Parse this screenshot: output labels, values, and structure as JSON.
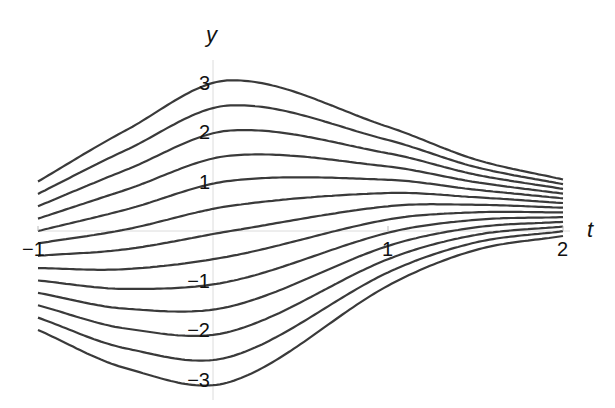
{
  "chart_data": {
    "type": "line",
    "title": "",
    "xlabel": "t",
    "ylabel": "y",
    "xlim": [
      -1,
      2
    ],
    "ylim": [
      -3.1,
      3.1
    ],
    "grid": false,
    "legend": null,
    "x_ticks": [
      -1,
      1,
      2
    ],
    "x_tick_labels": [
      "−1",
      "1",
      "2"
    ],
    "y_ticks": [
      3,
      2,
      1,
      -1,
      -2,
      -3
    ],
    "y_tick_labels": [
      "3",
      "2",
      "1",
      "−1",
      "−2",
      "−3"
    ],
    "initial_values": [
      1,
      0.75,
      0.5,
      0.25,
      0,
      -0.25,
      -0.5,
      -0.75,
      -1,
      -1.25,
      -1.5,
      -1.75,
      -2
    ],
    "model": {
      "form": "y(t) = (y0 + 0.5) * g(t) + c(t)",
      "t": [
        -1,
        -0.5,
        0.1,
        1,
        1.5,
        2
      ],
      "g": [
        1.0,
        1.6,
        2.03,
        1.07,
        0.61,
        0.38
      ],
      "c": [
        -0.5,
        -0.37,
        0.0,
        0.5,
        0.53,
        0.47
      ]
    },
    "series_samples": [
      {
        "name": "y0=1",
        "x": [
          -1,
          -0.5,
          0.1,
          1,
          1.5,
          2
        ],
        "y": [
          1.0,
          2.03,
          3.05,
          1.6,
          0.92,
          1.04
        ]
      },
      {
        "name": "y0=-2",
        "x": [
          -1,
          -0.5,
          0.1,
          1,
          1.5,
          2
        ],
        "y": [
          -2.0,
          -2.77,
          -3.05,
          -1.1,
          -0.39,
          -0.1
        ]
      }
    ],
    "line_color": "#3a3a3a",
    "axis_color": "#dddddd"
  },
  "labels": {
    "x_axis": "t",
    "y_axis": "y"
  }
}
